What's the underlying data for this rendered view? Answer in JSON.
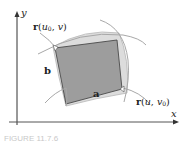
{
  "figure": {
    "axes": {
      "x_label": "x",
      "y_label": "y"
    },
    "vectors": {
      "a_label": "a",
      "b_label": "b"
    },
    "curves": {
      "u_curve": {
        "prefix": "r",
        "open": "(",
        "var1": "u",
        "sub1": "0",
        "sep": ", ",
        "var2": "v",
        "close": ")"
      },
      "v_curve": {
        "prefix": "r",
        "open": "(",
        "var1": "u",
        "sep": ", ",
        "var2": "v",
        "sub2": "0",
        "close": ")"
      }
    },
    "caption": "FIGURE 11.7.6",
    "colors": {
      "patch_light": "#d9d9d9",
      "parallelogram": "#9c9c9c",
      "curve": "#b0b0b0",
      "axis": "#333333",
      "text": "#222222"
    }
  }
}
